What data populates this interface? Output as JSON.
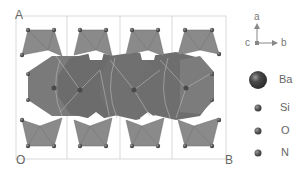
{
  "figure": {
    "cell_labels": {
      "top_left": "A",
      "origin": "O",
      "bottom_right": "B"
    },
    "colors": {
      "polyhedra_dark": "#6e6e6e",
      "polyhedra_mid": "#858585",
      "tetrahedra": "#8a8a8a",
      "edges": "#b8b8b8",
      "cell_line": "#cfcfcf",
      "atom": "#555555"
    }
  },
  "axes": {
    "a": "a",
    "b": "b",
    "c": "c"
  },
  "legend": {
    "items": [
      {
        "label": "Ba",
        "size": "large",
        "color": "#4a4a4a"
      },
      {
        "label": "Si",
        "size": "small",
        "color": "#5a5a5a"
      },
      {
        "label": "O",
        "size": "small",
        "color": "#6a6a6a"
      },
      {
        "label": "N",
        "size": "small",
        "color": "#505050"
      }
    ]
  }
}
